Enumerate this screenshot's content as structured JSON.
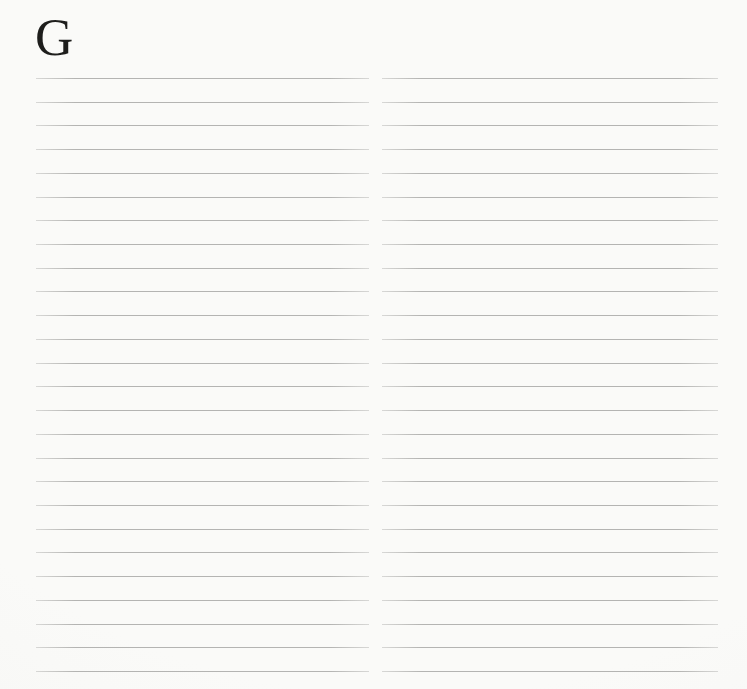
{
  "page": {
    "section_letter": "G",
    "columns": {
      "left": {
        "line_count": 26
      },
      "right": {
        "line_count": 26
      }
    },
    "colors": {
      "background": "#fafaf8",
      "background_edge": "#f3f3f1",
      "line": "#bdbdbb",
      "letter": "#1e1e1c"
    }
  }
}
